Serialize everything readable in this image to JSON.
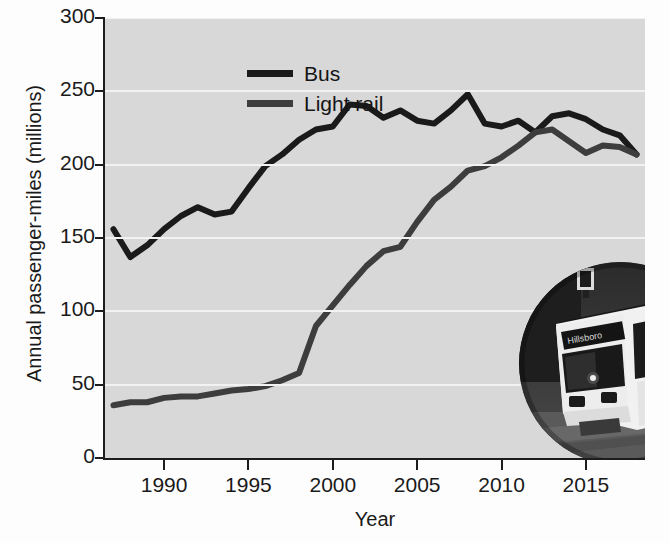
{
  "figure": {
    "background_color": "#fdfdfd",
    "plot_background_color": "#d8d8d8",
    "gridline_color": "#f2f2f2",
    "axis_color": "#1d1d1d"
  },
  "chart_data": {
    "type": "line",
    "title": "",
    "xlabel": "Year",
    "ylabel": "Annual passenger-miles (millions)",
    "xlim": [
      1986.5,
      2018.5
    ],
    "ylim": [
      0,
      300
    ],
    "xticks": [
      1990,
      1995,
      2000,
      2005,
      2010,
      2015
    ],
    "xtick_labels": [
      "1990",
      "1995",
      "2000",
      "2005",
      "2010",
      "2015"
    ],
    "yticks": [
      0,
      50,
      100,
      150,
      200,
      250,
      300
    ],
    "ytick_labels": [
      "0",
      "50",
      "100",
      "150",
      "200",
      "250",
      "300"
    ],
    "grid": "horizontal",
    "legend_position": "upper-left-inside",
    "x": [
      1987,
      1988,
      1989,
      1990,
      1991,
      1992,
      1993,
      1994,
      1995,
      1996,
      1997,
      1998,
      1999,
      2000,
      2001,
      2002,
      2003,
      2004,
      2005,
      2006,
      2007,
      2008,
      2009,
      2010,
      2011,
      2012,
      2013,
      2014,
      2015,
      2016,
      2017,
      2018
    ],
    "series": [
      {
        "name": "Bus",
        "color": "#1a1a1a",
        "values": [
          156,
          137,
          145,
          156,
          165,
          171,
          166,
          168,
          184,
          199,
          207,
          217,
          224,
          226,
          241,
          240,
          232,
          237,
          230,
          228,
          237,
          248,
          228,
          226,
          230,
          222,
          233,
          235,
          231,
          224,
          220,
          207
        ]
      },
      {
        "name": "Light rail",
        "color": "#3d3d3d",
        "values": [
          36,
          38,
          38,
          41,
          42,
          42,
          44,
          46,
          47,
          49,
          53,
          58,
          90,
          104,
          118,
          131,
          141,
          144,
          161,
          176,
          185,
          196,
          199,
          205,
          213,
          222,
          224,
          216,
          208,
          213,
          212,
          207
        ]
      }
    ]
  },
  "legend": {
    "items": [
      {
        "label": "Bus",
        "color": "#1a1a1a"
      },
      {
        "label": "Light rail",
        "color": "#3d3d3d"
      }
    ]
  },
  "inset": {
    "caption": "light-rail-train-photo",
    "destination_sign": "Hillsboro"
  }
}
